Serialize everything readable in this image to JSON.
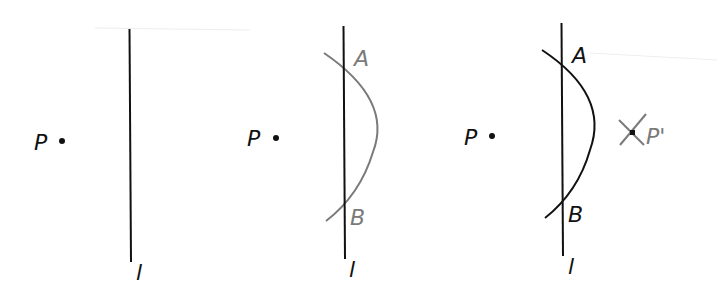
{
  "figure": {
    "colors": {
      "ink": "#111111",
      "construction_gray": "#7a7a7a",
      "background": "#ffffff"
    },
    "panels": [
      {
        "id": "step-1",
        "point_label": "P",
        "line_label": "l"
      },
      {
        "id": "step-2",
        "point_label": "P",
        "line_label": "l",
        "intersection_labels": [
          "A",
          "B"
        ],
        "arc_color": "gray"
      },
      {
        "id": "step-3",
        "point_label": "P",
        "line_label": "l",
        "intersection_labels": [
          "A",
          "B"
        ],
        "image_point_label": "P'",
        "arc_color": "black"
      }
    ]
  }
}
